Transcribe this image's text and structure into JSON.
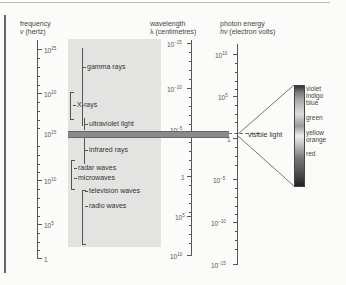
{
  "headers": {
    "frequency": {
      "title": "frequency",
      "symbol": "ν",
      "unit": "(hertz)"
    },
    "wavelength": {
      "title": "wavelength",
      "symbol": "λ",
      "unit": "(centimetres)"
    },
    "energy": {
      "title": "photon energy",
      "symbol": "hν",
      "unit": "(electron volts)"
    }
  },
  "frequency_axis": {
    "labels": [
      {
        "base": "10",
        "exp": "25"
      },
      {
        "base": "10",
        "exp": "20"
      },
      {
        "base": "10",
        "exp": "15"
      },
      {
        "base": "10",
        "exp": "10"
      },
      {
        "base": "10",
        "exp": "5"
      },
      {
        "base": "1",
        "exp": ""
      }
    ]
  },
  "wavelength_axis": {
    "labels": [
      {
        "base": "10",
        "exp": "−15"
      },
      {
        "base": "10",
        "exp": "−10"
      },
      {
        "base": "10",
        "exp": "−5"
      },
      {
        "base": "1",
        "exp": ""
      },
      {
        "base": "10",
        "exp": "5"
      },
      {
        "base": "10",
        "exp": "10"
      }
    ]
  },
  "energy_axis": {
    "labels": [
      {
        "base": "10",
        "exp": "10"
      },
      {
        "base": "10",
        "exp": "5"
      },
      {
        "base": "1",
        "exp": ""
      },
      {
        "base": "10",
        "exp": "−5"
      },
      {
        "base": "10",
        "exp": "−10"
      },
      {
        "base": "10",
        "exp": "−15"
      }
    ]
  },
  "bands": [
    {
      "name": "gamma rays"
    },
    {
      "name": "X-rays"
    },
    {
      "name": "ultraviolet light"
    },
    {
      "name": "infrared rays"
    },
    {
      "name": "radar waves"
    },
    {
      "name": "microwaves"
    },
    {
      "name": "television waves"
    },
    {
      "name": "radio waves"
    }
  ],
  "visible": {
    "label": "visible light",
    "colors": [
      "violet",
      "indigo",
      "blue",
      "green",
      "yellow",
      "orange",
      "red"
    ]
  }
}
